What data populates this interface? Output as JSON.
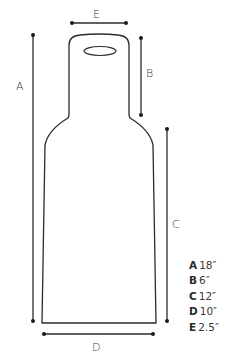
{
  "diagram": {
    "type": "dimension-diagram",
    "labels": {
      "A": "A",
      "B": "B",
      "C": "C",
      "D": "D",
      "E": "E"
    },
    "legend": [
      {
        "key": "A",
        "value": "18″"
      },
      {
        "key": "B",
        "value": "6″"
      },
      {
        "key": "C",
        "value": "12″"
      },
      {
        "key": "D",
        "value": "10″"
      },
      {
        "key": "E",
        "value": "2.5″"
      }
    ],
    "colors": {
      "line": "#2b2b2b",
      "background": "#ffffff"
    }
  }
}
